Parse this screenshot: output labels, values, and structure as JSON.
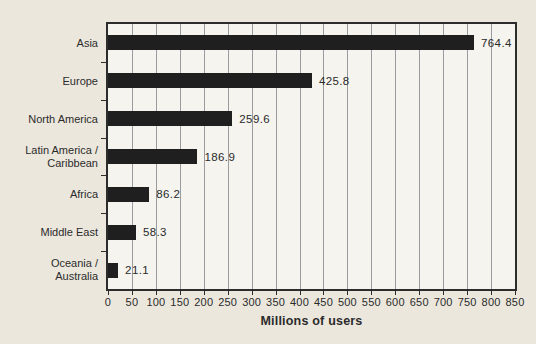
{
  "chart_data": {
    "type": "bar",
    "orientation": "horizontal",
    "title": "",
    "xlabel": "Millions of users",
    "ylabel": "",
    "categories": [
      "Asia",
      "Europe",
      "North America",
      "Latin America /\nCaribbean",
      "Africa",
      "Middle East",
      "Oceania /\nAustralia"
    ],
    "values": [
      764.4,
      425.8,
      259.6,
      186.9,
      86.2,
      58.3,
      21.1
    ],
    "value_labels": [
      "764.4",
      "425.8",
      "259.6",
      "186.9",
      "86.2",
      "58.3",
      "21.1"
    ],
    "xlim": [
      0,
      850
    ],
    "xtick_step": 50,
    "xticks": [
      0,
      50,
      100,
      150,
      200,
      250,
      300,
      350,
      400,
      450,
      500,
      550,
      600,
      650,
      700,
      750,
      800,
      850
    ],
    "grid": "vertical",
    "legend": "none",
    "colors": {
      "bar": "#1f1f1f",
      "plot_background": "#f5f4ef",
      "page_background": "#ebe7dd",
      "gridline": "#9b9b9f",
      "border": "#2c2c2c",
      "text": "#2b2b2b"
    }
  }
}
